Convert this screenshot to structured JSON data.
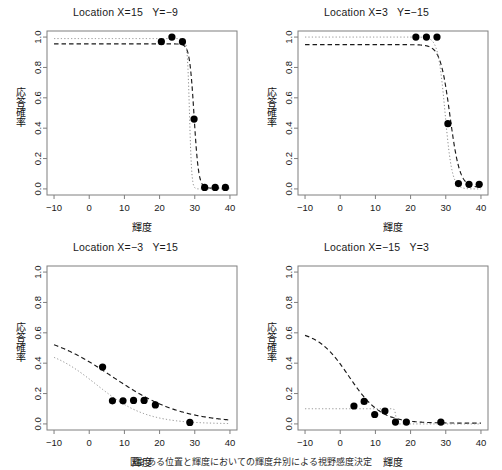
{
  "figure": {
    "caption": "図2 ある位置と輝度においての輝度弁別による視野感度決定",
    "axis_labels": {
      "x": "輝度",
      "y": "応答確率"
    },
    "colors": {
      "point": "#000000",
      "fit_curve": "#1a1a1a",
      "reference_curve": "#8c8c8c",
      "axis": "#7f7f7f",
      "background": "#ffffff"
    },
    "panel_titles": [
      "Location X=15   Y=−9",
      "Location X=3   Y=−15",
      "Location X=−3   Y=15",
      "Location X=−15   Y=3"
    ]
  },
  "chart_data": [
    {
      "type": "scatter",
      "title": "Location X=15   Y=−9",
      "xlabel": "輝度",
      "ylabel": "応答確率",
      "xlim": [
        -12,
        42
      ],
      "ylim": [
        -0.04,
        1.04
      ],
      "xticks": [
        -10,
        0,
        10,
        20,
        30,
        40
      ],
      "xtick_labels": [
        "−10",
        "0",
        "10",
        "20",
        "30",
        "40"
      ],
      "yticks": [
        0.0,
        0.2,
        0.4,
        0.6,
        0.8,
        1.0
      ],
      "ytick_labels": [
        "0.0",
        "0.2",
        "0.4",
        "0.6",
        "0.8",
        "1.0"
      ],
      "grid": false,
      "legend": "none",
      "points": [
        {
          "x": 20.5,
          "y": 0.97
        },
        {
          "x": 23.5,
          "y": 1.0
        },
        {
          "x": 26.5,
          "y": 0.97
        },
        {
          "x": 29.8,
          "y": 0.46
        },
        {
          "x": 32.8,
          "y": 0.01
        },
        {
          "x": 35.8,
          "y": 0.01
        },
        {
          "x": 38.7,
          "y": 0.01
        }
      ],
      "series": [
        {
          "name": "fit_curve",
          "style": "dashed",
          "description": "Descending logistic fit: upper asymptote 0.955, lower asymptote 0.005, threshold 29.8, slope steep",
          "upper": 0.955,
          "lower": 0.005,
          "threshold": 29.8,
          "slope": 1.55
        },
        {
          "name": "reference_curve",
          "style": "dotted",
          "description": "Reference step near 0.99 dropping at about 28.5",
          "upper": 0.99,
          "lower": 0.0,
          "threshold": 28.5,
          "slope": 3.2
        }
      ]
    },
    {
      "type": "scatter",
      "title": "Location X=3   Y=−15",
      "xlabel": "輝度",
      "ylabel": "応答確率",
      "xlim": [
        -12,
        42
      ],
      "ylim": [
        -0.04,
        1.04
      ],
      "xticks": [
        -10,
        0,
        10,
        20,
        30,
        40
      ],
      "xtick_labels": [
        "−10",
        "0",
        "10",
        "20",
        "30",
        "40"
      ],
      "yticks": [
        0.0,
        0.2,
        0.4,
        0.6,
        0.8,
        1.0
      ],
      "ytick_labels": [
        "0.0",
        "0.2",
        "0.4",
        "0.6",
        "0.8",
        "1.0"
      ],
      "grid": false,
      "legend": "none",
      "points": [
        {
          "x": 21.5,
          "y": 1.0
        },
        {
          "x": 24.5,
          "y": 1.0
        },
        {
          "x": 27.5,
          "y": 1.0
        },
        {
          "x": 30.6,
          "y": 0.43
        },
        {
          "x": 33.6,
          "y": 0.035
        },
        {
          "x": 36.6,
          "y": 0.03
        },
        {
          "x": 39.5,
          "y": 0.03
        }
      ],
      "series": [
        {
          "name": "fit_curve",
          "style": "dashed",
          "description": "Descending logistic fit: upper asymptote 0.95, lower asymptote 0.01, threshold 31.2, moderate slope",
          "upper": 0.95,
          "lower": 0.01,
          "threshold": 31.2,
          "slope": 0.72
        },
        {
          "name": "reference_curve",
          "style": "dotted",
          "description": "Reference step near 1.0 dropping at about 29.5",
          "upper": 1.0,
          "lower": 0.0,
          "threshold": 29.8,
          "slope": 1.0
        }
      ]
    },
    {
      "type": "scatter",
      "title": "Location X=−3   Y=15",
      "xlabel": "輝度",
      "ylabel": "応答確率",
      "xlim": [
        -12,
        42
      ],
      "ylim": [
        -0.04,
        1.04
      ],
      "xticks": [
        -10,
        0,
        10,
        20,
        30,
        40
      ],
      "xtick_labels": [
        "−10",
        "0",
        "10",
        "20",
        "30",
        "40"
      ],
      "yticks": [
        0.0,
        0.2,
        0.4,
        0.6,
        0.8,
        1.0
      ],
      "ytick_labels": [
        "0.0",
        "0.2",
        "0.4",
        "0.6",
        "0.8",
        "1.0"
      ],
      "grid": false,
      "legend": "none",
      "points": [
        {
          "x": 3.8,
          "y": 0.375
        },
        {
          "x": 6.6,
          "y": 0.152
        },
        {
          "x": 9.6,
          "y": 0.152
        },
        {
          "x": 12.6,
          "y": 0.155
        },
        {
          "x": 15.6,
          "y": 0.155
        },
        {
          "x": 18.8,
          "y": 0.125
        },
        {
          "x": 28.6,
          "y": 0.01
        }
      ],
      "series": [
        {
          "name": "fit_curve",
          "style": "dashed",
          "description": "Shallow descending curve from 0.61 at x=-10 to near 0.01 at x=40",
          "upper": 0.62,
          "lower": 0.005,
          "threshold": 6.5,
          "slope": 0.1
        },
        {
          "name": "reference_curve",
          "style": "dotted",
          "description": "Reference shallow line from 0.52 at x=-10 merging with fit around x=5",
          "upper": 0.52,
          "lower": 0.0,
          "threshold": 2.0,
          "slope": 0.14
        }
      ]
    },
    {
      "type": "scatter",
      "title": "Location X=−15   Y=3",
      "xlabel": "輝度",
      "ylabel": "応答確率",
      "xlim": [
        -12,
        42
      ],
      "ylim": [
        -0.04,
        1.04
      ],
      "xticks": [
        -10,
        0,
        10,
        20,
        30,
        40
      ],
      "xtick_labels": [
        "−10",
        "0",
        "10",
        "20",
        "30",
        "40"
      ],
      "yticks": [
        0.0,
        0.2,
        0.4,
        0.6,
        0.8,
        1.0
      ],
      "ytick_labels": [
        "0.0",
        "0.2",
        "0.4",
        "0.6",
        "0.8",
        "1.0"
      ],
      "grid": false,
      "legend": "none",
      "points": [
        {
          "x": 3.9,
          "y": 0.118
        },
        {
          "x": 6.8,
          "y": 0.148
        },
        {
          "x": 9.8,
          "y": 0.062
        },
        {
          "x": 12.7,
          "y": 0.085
        },
        {
          "x": 15.7,
          "y": 0.012
        },
        {
          "x": 18.8,
          "y": 0.012
        },
        {
          "x": 28.6,
          "y": 0.012
        }
      ],
      "series": [
        {
          "name": "fit_curve",
          "style": "dashed",
          "description": "Descending curve from 0.61 at x=-10 to near 0.005 beyond x=18",
          "upper": 0.62,
          "lower": 0.005,
          "threshold": 2.5,
          "slope": 0.22
        },
        {
          "name": "reference_curve",
          "style": "dotted",
          "description": "Reference step at 0.10 dropping to 0 at about x=16",
          "upper": 0.1,
          "lower": 0.0,
          "threshold": 15.8,
          "slope": 6.0
        }
      ]
    }
  ]
}
